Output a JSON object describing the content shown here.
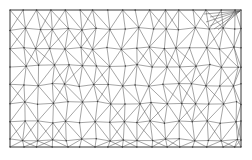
{
  "figure": {
    "kind": "wireframe-mesh-diagram",
    "background_color": "#ffffff",
    "edge_color": "#5a5a5a",
    "boundary_color": "#4a4a4a",
    "node_color": "#3a3a3a",
    "edge_width": 0.55,
    "node_radius": 0.75
  },
  "chart_data": {
    "type": "diagram",
    "title": "",
    "xlabel": "",
    "ylabel": "",
    "grid": false,
    "legend": null,
    "domain": {
      "x_min": 10,
      "x_max": 241,
      "y_min": 10,
      "y_max": 147,
      "rows": 8,
      "columns": 17
    },
    "rows_y": [
      10,
      29,
      48,
      66,
      85,
      103,
      122,
      140,
      147
    ],
    "node_rows": [
      {
        "row": 0,
        "y": 10,
        "x": [
          10,
          24,
          38,
          52,
          66,
          80,
          94,
          108,
          122,
          136,
          150,
          164,
          178,
          192,
          206,
          220,
          234,
          241
        ]
      },
      {
        "row": 1,
        "y": 29,
        "x": [
          10,
          25,
          39,
          53,
          67,
          81,
          95,
          110,
          124,
          138,
          152,
          166,
          180,
          194,
          208,
          222,
          236,
          241
        ]
      },
      {
        "row": 2,
        "y": 48,
        "x": [
          10,
          23,
          37,
          51,
          66,
          80,
          93,
          107,
          121,
          136,
          150,
          163,
          177,
          191,
          206,
          220,
          233,
          241
        ]
      },
      {
        "row": 3,
        "y": 66,
        "x": [
          10,
          25,
          39,
          54,
          68,
          82,
          96,
          110,
          124,
          138,
          152,
          167,
          181,
          195,
          209,
          223,
          237,
          241
        ]
      },
      {
        "row": 4,
        "y": 85,
        "x": [
          10,
          23,
          37,
          52,
          65,
          79,
          94,
          108,
          122,
          135,
          149,
          164,
          178,
          192,
          205,
          219,
          234,
          241
        ]
      },
      {
        "row": 5,
        "y": 103,
        "x": [
          10,
          25,
          39,
          53,
          68,
          82,
          96,
          110,
          125,
          139,
          152,
          166,
          181,
          195,
          209,
          223,
          237,
          241
        ]
      },
      {
        "row": 6,
        "y": 122,
        "x": [
          10,
          24,
          38,
          52,
          66,
          80,
          94,
          109,
          123,
          137,
          151,
          165,
          179,
          193,
          207,
          221,
          235,
          241
        ]
      },
      {
        "row": 7,
        "y": 140,
        "x": [
          10,
          24,
          38,
          53,
          67,
          81,
          95,
          109,
          123,
          138,
          152,
          166,
          180,
          194,
          208,
          222,
          236,
          241
        ]
      },
      {
        "row": 8,
        "y": 147,
        "x": [
          10,
          24,
          38,
          53,
          67,
          81,
          95,
          109,
          123,
          138,
          152,
          166,
          180,
          194,
          208,
          222,
          236,
          241
        ]
      }
    ],
    "corner_fan": {
      "apex_x": 240,
      "apex_y": 11,
      "targets": [
        [
          206,
          22
        ],
        [
          210,
          26
        ],
        [
          214,
          29
        ],
        [
          218,
          30
        ],
        [
          210,
          17
        ],
        [
          204,
          14
        ]
      ]
    }
  }
}
